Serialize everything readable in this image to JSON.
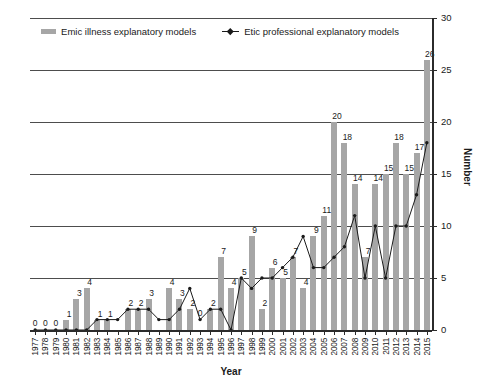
{
  "chart_data": {
    "type": "bar",
    "title": "",
    "xlabel": "Year",
    "ylabel": "Number",
    "ylim": [
      0,
      30
    ],
    "ytick_values": [
      0,
      5,
      10,
      15,
      20,
      25,
      30
    ],
    "grid": true,
    "legend_position": "top-center",
    "categories": [
      "1977",
      "1978",
      "1979",
      "1980",
      "1981",
      "1982",
      "1983",
      "1984",
      "1985",
      "1986",
      "1987",
      "1988",
      "1989",
      "1990",
      "1991",
      "1992",
      "1993",
      "1994",
      "1995",
      "1996",
      "1997",
      "1998",
      "1999",
      "2000",
      "2001",
      "2002",
      "2003",
      "2004",
      "2005",
      "2006",
      "2007",
      "2008",
      "2009",
      "2010",
      "2011",
      "2012",
      "2013",
      "2014",
      "2015"
    ],
    "series": [
      {
        "name": "Emic illness explanatory models",
        "kind": "bar",
        "color": "#a6a6a6",
        "values": [
          0,
          0,
          0,
          1,
          3,
          4,
          1,
          1,
          0,
          2,
          2,
          3,
          0,
          4,
          3,
          2,
          0,
          2,
          7,
          4,
          5,
          9,
          2,
          6,
          5,
          7,
          4,
          9,
          11,
          20,
          18,
          14,
          7,
          14,
          15,
          18,
          15,
          17,
          26
        ],
        "labels": [
          "",
          "",
          "",
          "1",
          "3",
          "4",
          "1",
          "1",
          "",
          "2",
          "2",
          "3",
          "",
          "4",
          "3",
          "2",
          "",
          "2",
          "7",
          "4",
          "5",
          "9",
          "2",
          "6",
          "5",
          "7",
          "4",
          "9",
          "11",
          "20",
          "18",
          "14",
          "7",
          "14",
          "15",
          "18",
          "15",
          "17",
          "26"
        ]
      },
      {
        "name": "Etic professional explanatory models",
        "kind": "line",
        "color": "#1a1a1a",
        "values": [
          0,
          0,
          0,
          0,
          0,
          0,
          1,
          1,
          1,
          2,
          2,
          2,
          1,
          1,
          2,
          4,
          1,
          2,
          2,
          0,
          5,
          4,
          5,
          5,
          6,
          7,
          9,
          6,
          6,
          7,
          8,
          11,
          5,
          10,
          5,
          10,
          10,
          13,
          18
        ],
        "labels": [
          "0",
          "0",
          "0",
          "",
          "",
          "",
          "",
          "",
          "",
          "",
          "",
          "",
          "",
          "",
          "",
          "",
          "0",
          "",
          "",
          "",
          "",
          "",
          "",
          "",
          "",
          "",
          "",
          "",
          "",
          "",
          "",
          "",
          "",
          "",
          "",
          "",
          "",
          "",
          ""
        ]
      }
    ]
  },
  "legend": {
    "entries": [
      {
        "label": "Emic illness explanatory models",
        "marker": "bar-swatch"
      },
      {
        "label": "Etic professional explanatory models",
        "marker": "line-marker"
      }
    ]
  },
  "axes": {
    "x_title": "Year",
    "y_title": "Number"
  }
}
